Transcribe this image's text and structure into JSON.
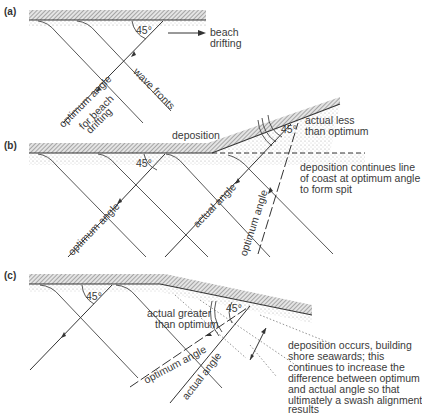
{
  "panels": {
    "a": {
      "label": "(a)",
      "angle": "45°",
      "arrow_label_1": "beach",
      "arrow_label_2": "drifting",
      "wave_fronts": "wave fronts",
      "ray_label_1": "optimum angle",
      "ray_label_2": "for beach",
      "ray_label_3": "drifting"
    },
    "b": {
      "label": "(b)",
      "angle_left": "45°",
      "angle_right": "45°",
      "deposition": "deposition",
      "actual_less_1": "actual less",
      "actual_less_2": "than optimum",
      "note_1": "deposition continues line",
      "note_2": "of coast at optimum angle",
      "note_3": "to form spit",
      "ray_optimum": "optimum angle",
      "ray_actual": "actual angle",
      "ray_optimum_dashed": "optimum angle"
    },
    "c": {
      "label": "(c)",
      "angle_left": "45°",
      "angle_right": "45°",
      "actual_greater_1": "actual greater",
      "actual_greater_2": "than optimum",
      "ray_optimum": "optimum angle",
      "ray_actual": "actual angle",
      "note_1": "deposition occurs, building",
      "note_2": "shore seawards; this",
      "note_3": "continues to increase the",
      "note_4": "difference between optimum",
      "note_5": "and actual angle so that",
      "note_6": "ultimately a swash alignment",
      "note_7": "results"
    }
  },
  "colors": {
    "line": "#333333",
    "hatch": "#8a8a8a",
    "stipple": "#b0b0b0"
  }
}
